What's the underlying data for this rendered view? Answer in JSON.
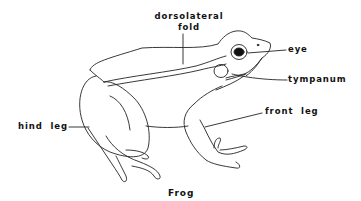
{
  "diagram": {
    "title": "Frog",
    "labels": {
      "dorsolateral_fold_line1": "dorsolateral",
      "dorsolateral_fold_line2": "fold",
      "eye": "eye",
      "tympanum": "tympanum",
      "front_leg": "front  leg",
      "hind_leg": "hind  leg"
    },
    "colors": {
      "background": "#ffffff",
      "stroke": "#222222",
      "text": "#111111"
    }
  }
}
